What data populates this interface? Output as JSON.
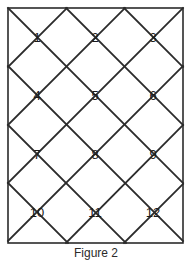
{
  "figure": {
    "caption": "Figure 2",
    "background_color": "#ffffff",
    "line_color": "#2b2b2b",
    "number_color": "#1a1a1a",
    "border": {
      "x": 8,
      "y": 8,
      "width": 175,
      "height": 235,
      "stroke_width": 1.6
    },
    "lattice": {
      "stroke_width": 1.8,
      "columns": 3,
      "rows": 4,
      "cell_width": 58,
      "cell_height": 58,
      "origin_x": 8,
      "origin_y": 8
    },
    "cells": [
      {
        "label": "1",
        "cx": 37,
        "cy": 38,
        "row": 1,
        "col": 1
      },
      {
        "label": "2",
        "cx": 95,
        "cy": 38,
        "row": 1,
        "col": 2
      },
      {
        "label": "3",
        "cx": 153,
        "cy": 38,
        "row": 1,
        "col": 3
      },
      {
        "label": "4",
        "cx": 37,
        "cy": 96,
        "row": 2,
        "col": 1
      },
      {
        "label": "5",
        "cx": 95,
        "cy": 96,
        "row": 2,
        "col": 2
      },
      {
        "label": "6",
        "cx": 153,
        "cy": 96,
        "row": 2,
        "col": 3
      },
      {
        "label": "7",
        "cx": 37,
        "cy": 155,
        "row": 3,
        "col": 1
      },
      {
        "label": "8",
        "cx": 95,
        "cy": 155,
        "row": 3,
        "col": 2
      },
      {
        "label": "9",
        "cx": 153,
        "cy": 155,
        "row": 3,
        "col": 3
      },
      {
        "label": "10",
        "cx": 37,
        "cy": 213,
        "row": 4,
        "col": 1
      },
      {
        "label": "11",
        "cx": 95,
        "cy": 213,
        "row": 4,
        "col": 2
      },
      {
        "label": "12",
        "cx": 153,
        "cy": 213,
        "row": 4,
        "col": 3
      }
    ],
    "diagonals_down": [
      {
        "x1": 8,
        "y1": 8,
        "x2": 183,
        "y2": 183
      },
      {
        "x1": 8,
        "y1": 66,
        "x2": 183,
        "y2": 241
      },
      {
        "x1": 8,
        "y1": 125,
        "x2": 126,
        "y2": 243
      },
      {
        "x1": 8,
        "y1": 183,
        "x2": 68,
        "y2": 243
      },
      {
        "x1": 66,
        "y1": 8,
        "x2": 183,
        "y2": 125
      },
      {
        "x1": 124,
        "y1": 8,
        "x2": 183,
        "y2": 67
      }
    ],
    "diagonals_up": [
      {
        "x1": 8,
        "y1": 67,
        "x2": 67,
        "y2": 8
      },
      {
        "x1": 8,
        "y1": 125,
        "x2": 125,
        "y2": 8
      },
      {
        "x1": 8,
        "y1": 183,
        "x2": 183,
        "y2": 8
      },
      {
        "x1": 8,
        "y1": 241,
        "x2": 183,
        "y2": 66
      },
      {
        "x1": 66,
        "y1": 243,
        "x2": 183,
        "y2": 125
      },
      {
        "x1": 124,
        "y1": 243,
        "x2": 183,
        "y2": 184
      }
    ]
  }
}
